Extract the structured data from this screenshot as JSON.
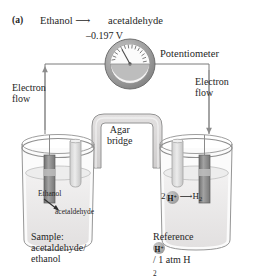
{
  "figure": {
    "panel_letter": "(a)",
    "title_reaction_left": "Ethanol",
    "title_reaction_arrow": "⟶",
    "title_reaction_right": "acetaldehyde",
    "voltage": "–0.197 V"
  },
  "labels": {
    "potentiometer": "Potentiometer",
    "electron_flow_left": "Electron\nflow",
    "electron_flow_left_line1": "Electron",
    "electron_flow_left_line2": "flow",
    "electron_flow_right_line1": "Electron",
    "electron_flow_right_line2": "flow",
    "agar_line1": "Agar",
    "agar_line2": "bridge"
  },
  "left_cell": {
    "in_beaker_species_from": "Ethanol",
    "in_beaker_species_to": "acetaldehyde",
    "caption_line1": "Sample:",
    "caption_line2": "acetaldehyde/",
    "caption_line3": "ethanol"
  },
  "right_cell": {
    "reaction_coefficient": "2",
    "reaction_ion": "H",
    "reaction_ion_charge": "+",
    "reaction_arrow": "⟶",
    "reaction_product": "H",
    "reaction_product_sub": "2",
    "caption_line1": "Reference",
    "caption_ion": "H",
    "caption_ion_charge": "+",
    "caption_line2_rest": "/ 1 atm H",
    "caption_line2_sub": "2"
  },
  "colors": {
    "ink": "#262626",
    "outline": "#8a8a8a",
    "solution_fill": "#eceaea",
    "electrode_dark": "#7d7d7d",
    "electrode_light": "#a5a5a5",
    "gauge_rim": "#9a9a9a",
    "glass": "#d8d8d8",
    "background": "#ffffff"
  }
}
